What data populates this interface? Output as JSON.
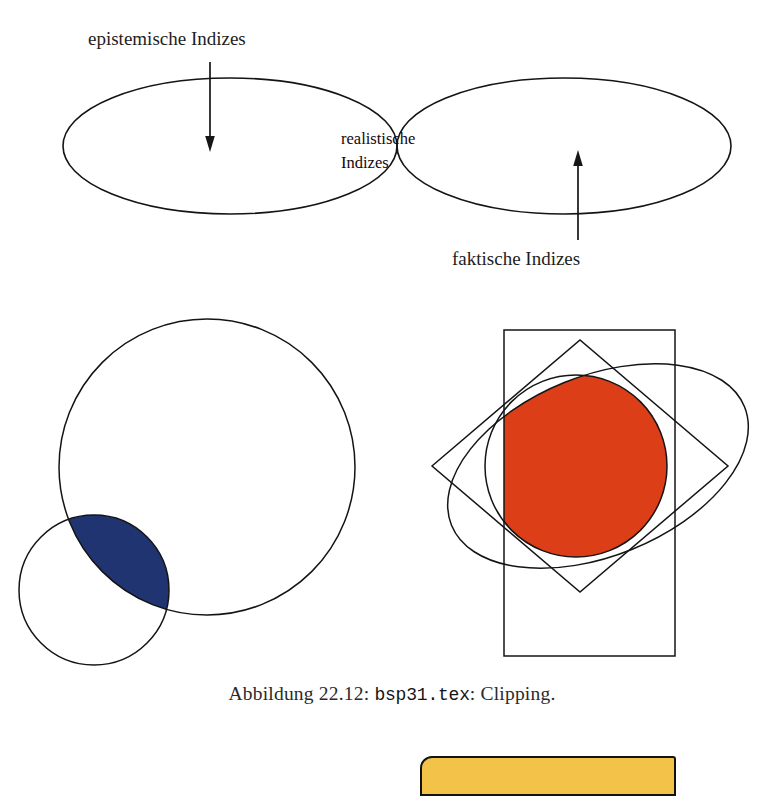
{
  "figure": {
    "caption_prefix": "Abbildung 22.12:",
    "caption_file": "bsp31.tex",
    "caption_suffix": ": Clipping."
  },
  "venn": {
    "left_label": "epistemische Indizes",
    "right_label": "faktische Indizes",
    "intersection_label_line1": "realistische",
    "intersection_label_line2": "Indizes",
    "intersection_fill": "#92628a",
    "outline_color": "#141414"
  },
  "clipping_left": {
    "lens_fill": "#1f3470",
    "outline_color": "#141414"
  },
  "clipping_right": {
    "clip_fill": "#dc3e17",
    "outline_color": "#141414"
  },
  "bottom_card": {
    "fill": "#f3c349",
    "border": "#121212"
  }
}
